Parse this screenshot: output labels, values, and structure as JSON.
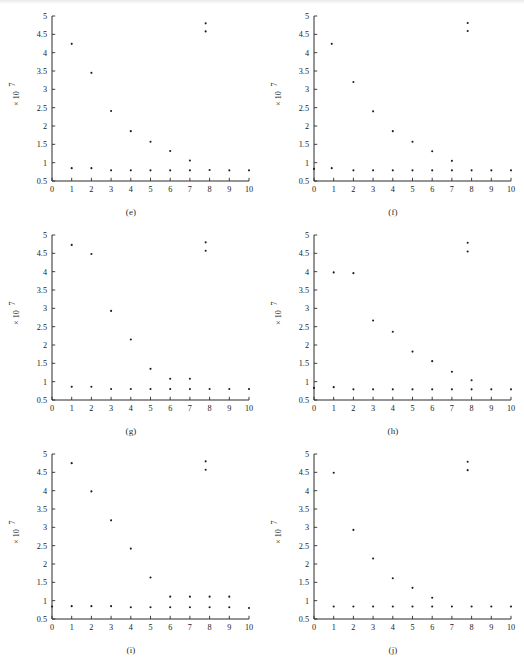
{
  "figure": {
    "background_color": "#ffffff",
    "ink_color": "#1d1d1d",
    "subplot_count": 6,
    "grid": "2 columns x 3 rows"
  },
  "axes_common": {
    "x_ticks": [
      "0",
      "1",
      "2",
      "3",
      "4",
      "5",
      "6",
      "7",
      "8",
      "9",
      "10"
    ],
    "y_ticks": [
      "0.5",
      "1",
      "1.5",
      "2",
      "2.5",
      "3",
      "3.5",
      "4",
      "4.5",
      "5"
    ],
    "y_axis_multiplier_mantissa": "× 10",
    "y_axis_multiplier_exponent": "7",
    "xlim": [
      0,
      10
    ],
    "ylim": [
      0.5,
      5
    ]
  },
  "subplots": [
    {
      "id": "e",
      "caption": "(e)"
    },
    {
      "id": "f",
      "caption": "(f)"
    },
    {
      "id": "g",
      "caption": "(g)"
    },
    {
      "id": "h",
      "caption": "(h)"
    },
    {
      "id": "i",
      "caption": "(i)"
    },
    {
      "id": "j",
      "caption": "(j)"
    }
  ],
  "chart_data": [
    {
      "type": "scatter",
      "title": "(e)",
      "xlabel": "",
      "ylabel": "× 10^7",
      "xlim": [
        0,
        10
      ],
      "ylim": [
        0.5,
        5
      ],
      "grid": false,
      "legend": "none",
      "x_ticks": [
        0,
        1,
        2,
        3,
        4,
        5,
        6,
        7,
        8,
        9,
        10
      ],
      "y_ticks": [
        0.5,
        1,
        1.5,
        2,
        2.5,
        3,
        3.5,
        4,
        4.5,
        5
      ],
      "series": [
        {
          "name": "upper-branch",
          "x": [
            1,
            2,
            3,
            4,
            5,
            6,
            7,
            7.8,
            7.8
          ],
          "y": [
            4.24,
            3.45,
            2.41,
            1.86,
            1.57,
            1.32,
            1.06,
            4.8,
            4.58
          ]
        },
        {
          "name": "baseline",
          "x": [
            1,
            2,
            3,
            4,
            5,
            6,
            7,
            8,
            9,
            10
          ],
          "y": [
            0.85,
            0.85,
            0.79,
            0.79,
            0.79,
            0.79,
            0.79,
            0.8,
            0.79,
            0.79
          ]
        }
      ]
    },
    {
      "type": "scatter",
      "title": "(f)",
      "xlabel": "",
      "ylabel": "× 10^7",
      "xlim": [
        0,
        10
      ],
      "ylim": [
        0.5,
        5
      ],
      "grid": false,
      "legend": "none",
      "x_ticks": [
        0,
        1,
        2,
        3,
        4,
        5,
        6,
        7,
        8,
        9,
        10
      ],
      "y_ticks": [
        0.5,
        1,
        1.5,
        2,
        2.5,
        3,
        3.5,
        4,
        4.5,
        5
      ],
      "series": [
        {
          "name": "upper-branch",
          "x": [
            0.9,
            2,
            3,
            4,
            5,
            6,
            7,
            7.8,
            7.8
          ],
          "y": [
            4.24,
            3.2,
            2.4,
            1.86,
            1.57,
            1.31,
            1.05,
            4.81,
            4.59
          ]
        },
        {
          "name": "baseline",
          "x": [
            0,
            0.9,
            2,
            3,
            4,
            5,
            6,
            7,
            8,
            9,
            10
          ],
          "y": [
            0.83,
            0.85,
            0.79,
            0.79,
            0.79,
            0.79,
            0.79,
            0.79,
            0.79,
            0.79,
            0.79
          ]
        }
      ]
    },
    {
      "type": "scatter",
      "title": "(g)",
      "xlabel": "",
      "ylabel": "× 10^7",
      "xlim": [
        0,
        10
      ],
      "ylim": [
        0.5,
        5
      ],
      "grid": false,
      "legend": "none",
      "x_ticks": [
        0,
        1,
        2,
        3,
        4,
        5,
        6,
        7,
        8,
        9,
        10
      ],
      "y_ticks": [
        0.5,
        1,
        1.5,
        2,
        2.5,
        3,
        3.5,
        4,
        4.5,
        5
      ],
      "series": [
        {
          "name": "upper-branch",
          "x": [
            1,
            2,
            3,
            4,
            5,
            6,
            7,
            7.8,
            7.8
          ],
          "y": [
            4.73,
            4.48,
            2.93,
            2.15,
            1.35,
            1.08,
            1.08,
            4.8,
            4.57
          ]
        },
        {
          "name": "baseline",
          "x": [
            1,
            2,
            3,
            4,
            5,
            6,
            7,
            8,
            9,
            10
          ],
          "y": [
            0.86,
            0.86,
            0.8,
            0.8,
            0.8,
            0.8,
            0.8,
            0.8,
            0.8,
            0.8
          ]
        }
      ]
    },
    {
      "type": "scatter",
      "title": "(h)",
      "xlabel": "",
      "ylabel": "× 10^7",
      "xlim": [
        0,
        10
      ],
      "ylim": [
        0.5,
        5
      ],
      "grid": false,
      "legend": "none",
      "x_ticks": [
        0,
        1,
        2,
        3,
        4,
        5,
        6,
        7,
        8,
        9,
        10
      ],
      "y_ticks": [
        0.5,
        1,
        1.5,
        2,
        2.5,
        3,
        3.5,
        4,
        4.5,
        5
      ],
      "series": [
        {
          "name": "upper-branch",
          "x": [
            1,
            2,
            3,
            4,
            5,
            6,
            7,
            8,
            7.8,
            7.8
          ],
          "y": [
            3.98,
            3.96,
            2.67,
            2.36,
            1.82,
            1.56,
            1.27,
            1.04,
            4.79,
            4.55
          ]
        },
        {
          "name": "baseline",
          "x": [
            0,
            1,
            2,
            3,
            4,
            5,
            6,
            7,
            8,
            9,
            10
          ],
          "y": [
            0.83,
            0.85,
            0.79,
            0.79,
            0.79,
            0.79,
            0.79,
            0.79,
            0.79,
            0.79,
            0.79
          ]
        }
      ]
    },
    {
      "type": "scatter",
      "title": "(i)",
      "xlabel": "",
      "ylabel": "× 10^7",
      "xlim": [
        0,
        10
      ],
      "ylim": [
        0.5,
        5
      ],
      "grid": false,
      "legend": "none",
      "x_ticks": [
        0,
        1,
        2,
        3,
        4,
        5,
        6,
        7,
        8,
        9,
        10
      ],
      "y_ticks": [
        0.5,
        1,
        1.5,
        2,
        2.5,
        3,
        3.5,
        4,
        4.5,
        5
      ],
      "series": [
        {
          "name": "upper-branch",
          "x": [
            1,
            2,
            3,
            4,
            5,
            6,
            7,
            8,
            9,
            7.8,
            7.8
          ],
          "y": [
            4.75,
            3.98,
            3.19,
            2.42,
            1.63,
            1.11,
            1.11,
            1.11,
            1.11,
            4.8,
            4.57
          ]
        },
        {
          "name": "baseline",
          "x": [
            0,
            1,
            2,
            3,
            4,
            5,
            6,
            7,
            8,
            9,
            10
          ],
          "y": [
            0.84,
            0.85,
            0.85,
            0.85,
            0.82,
            0.82,
            0.82,
            0.82,
            0.82,
            0.82,
            0.8
          ]
        }
      ]
    },
    {
      "type": "scatter",
      "title": "(j)",
      "xlabel": "",
      "ylabel": "× 10^7",
      "xlim": [
        0,
        10
      ],
      "ylim": [
        0.5,
        5
      ],
      "grid": false,
      "legend": "none",
      "x_ticks": [
        0,
        1,
        2,
        3,
        4,
        5,
        6,
        7,
        8,
        9,
        10
      ],
      "y_ticks": [
        0.5,
        1,
        1.5,
        2,
        2.5,
        3,
        3.5,
        4,
        4.5,
        5
      ],
      "series": [
        {
          "name": "upper-branch",
          "x": [
            1,
            2,
            3,
            4,
            5,
            6,
            7.8,
            7.8
          ],
          "y": [
            4.49,
            2.93,
            2.15,
            1.61,
            1.35,
            1.08,
            4.79,
            4.56
          ]
        },
        {
          "name": "baseline",
          "x": [
            1,
            2,
            3,
            4,
            5,
            6,
            7,
            8,
            9,
            10
          ],
          "y": [
            0.84,
            0.84,
            0.84,
            0.84,
            0.84,
            0.84,
            0.84,
            0.84,
            0.84,
            0.84
          ]
        }
      ]
    }
  ]
}
